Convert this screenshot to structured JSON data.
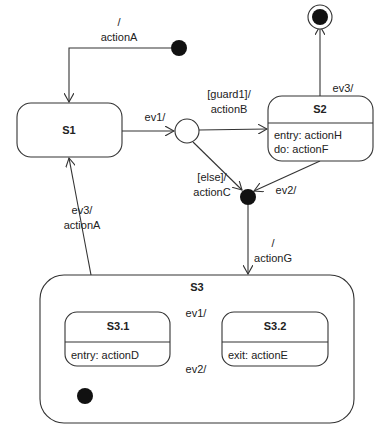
{
  "diagram": {
    "type": "uml-state-machine",
    "line_color": "#333333",
    "fill_color": "#ffffff",
    "dot_color": "#111111",
    "states": {
      "s1": {
        "name": "S1"
      },
      "s2": {
        "name": "S2",
        "internal": [
          "entry: actionH",
          "do: actionF"
        ]
      },
      "s3": {
        "name": "S3"
      },
      "s3_1": {
        "name": "S3.1",
        "internal": [
          "entry: actionD"
        ]
      },
      "s3_2": {
        "name": "S3.2",
        "internal": [
          "exit: actionE"
        ]
      }
    },
    "transitions": {
      "initial_to_s1": {
        "line1": "/",
        "line2": "actionA"
      },
      "s1_to_choice": {
        "label": "ev1/"
      },
      "choice_to_s2": {
        "line1": "[guard1]/",
        "line2": "actionB"
      },
      "choice_to_junction": {
        "line1": "[else]/",
        "line2": "actionC"
      },
      "s2_to_final": {
        "label": "ev3/"
      },
      "s2_to_junction": {
        "label": "ev2/"
      },
      "junction_to_s3": {
        "line1": "/",
        "line2": "actionG"
      },
      "s3_to_s1": {
        "line1": "ev3/",
        "line2": "actionA"
      },
      "s3_1_to_s3_2": {
        "label": "ev1/"
      },
      "s3_2_to_s3_1": {
        "label": "ev2/"
      }
    },
    "pseudostates": [
      "initial (top)",
      "choice",
      "junction",
      "final",
      "initial (inside S3)"
    ]
  }
}
